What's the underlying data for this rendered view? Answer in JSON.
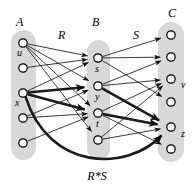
{
  "figure": {
    "title_label_bottom": "R*S",
    "colors": {
      "column_fill": "#d8d8d8",
      "node_stroke": "#000000",
      "node_fill": "#ffffff",
      "edge": "#1a1a1a",
      "background": "#ffffff"
    },
    "set_labels": [
      {
        "name": "A",
        "text": "A",
        "x": 16,
        "y": 26
      },
      {
        "name": "B",
        "text": "B",
        "x": 92,
        "y": 26
      },
      {
        "name": "C",
        "text": "C",
        "x": 168,
        "y": 17
      }
    ],
    "relation_labels": [
      {
        "name": "R",
        "text": "R",
        "x": 58,
        "y": 39
      },
      {
        "name": "S",
        "text": "S",
        "x": 133,
        "y": 39
      },
      {
        "name": "RS",
        "text": "R*S",
        "x": 97,
        "y": 180
      }
    ],
    "columns": [
      {
        "name": "A",
        "x": 11,
        "y": 30,
        "w": 25,
        "h": 130
      },
      {
        "name": "B",
        "x": 87,
        "y": 40,
        "w": 23,
        "h": 120
      },
      {
        "name": "C",
        "x": 158,
        "y": 22,
        "w": 26,
        "h": 140
      }
    ],
    "nodes": [
      {
        "id": "a1",
        "set": "A",
        "label": "u",
        "cx": 23,
        "cy": 43,
        "lx": 17,
        "ly": 56
      },
      {
        "id": "a2",
        "set": "A",
        "label": "",
        "cx": 23,
        "cy": 68,
        "lx": 0,
        "ly": 0
      },
      {
        "id": "a3",
        "set": "A",
        "label": "x",
        "cx": 23,
        "cy": 93,
        "lx": 15,
        "ly": 106
      },
      {
        "id": "a4",
        "set": "A",
        "label": "",
        "cx": 23,
        "cy": 118,
        "lx": 0,
        "ly": 0
      },
      {
        "id": "a5",
        "set": "A",
        "label": "",
        "cx": 23,
        "cy": 143,
        "lx": 0,
        "ly": 0
      },
      {
        "id": "b1",
        "set": "B",
        "label": "s",
        "cx": 98,
        "cy": 58,
        "lx": 95,
        "ly": 72
      },
      {
        "id": "b2",
        "set": "B",
        "label": "y",
        "cx": 98,
        "cy": 86,
        "lx": 95,
        "ly": 100
      },
      {
        "id": "b3",
        "set": "B",
        "label": "t",
        "cx": 98,
        "cy": 113,
        "lx": 96,
        "ly": 127
      },
      {
        "id": "b4",
        "set": "B",
        "label": "",
        "cx": 98,
        "cy": 140,
        "lx": 0,
        "ly": 0
      },
      {
        "id": "c1",
        "set": "C",
        "label": "",
        "cx": 171,
        "cy": 35,
        "lx": 0,
        "ly": 0
      },
      {
        "id": "c2",
        "set": "C",
        "label": "",
        "cx": 171,
        "cy": 57,
        "lx": 0,
        "ly": 0
      },
      {
        "id": "c3",
        "set": "C",
        "label": "v",
        "cx": 171,
        "cy": 79,
        "lx": 181,
        "ly": 88
      },
      {
        "id": "c4",
        "set": "C",
        "label": "",
        "cx": 171,
        "cy": 102,
        "lx": 0,
        "ly": 0
      },
      {
        "id": "c5",
        "set": "C",
        "label": "z",
        "cx": 171,
        "cy": 127,
        "lx": 181,
        "ly": 137
      },
      {
        "id": "c6",
        "set": "C",
        "label": "",
        "cx": 171,
        "cy": 149,
        "lx": 0,
        "ly": 0
      }
    ],
    "edges": [
      {
        "name": "u-s",
        "from": "a1",
        "to": "b1",
        "bold": false
      },
      {
        "name": "u-y",
        "from": "a1",
        "to": "b2",
        "bold": false
      },
      {
        "name": "u-t",
        "from": "a1",
        "to": "b3",
        "bold": false
      },
      {
        "name": "u-b4",
        "from": "a1",
        "to": "b4",
        "bold": false
      },
      {
        "name": "a2-s",
        "from": "a2",
        "to": "b1",
        "bold": false
      },
      {
        "name": "x-s",
        "from": "a3",
        "to": "b1",
        "bold": false
      },
      {
        "name": "x-y",
        "from": "a3",
        "to": "b2",
        "bold": true
      },
      {
        "name": "x-t",
        "from": "a3",
        "to": "b3",
        "bold": true
      },
      {
        "name": "a4-y",
        "from": "a4",
        "to": "b2",
        "bold": false
      },
      {
        "name": "a4-t",
        "from": "a4",
        "to": "b3",
        "bold": false
      },
      {
        "name": "a5-t",
        "from": "a5",
        "to": "b3",
        "bold": false
      },
      {
        "name": "s-c1",
        "from": "b1",
        "to": "c1",
        "bold": false
      },
      {
        "name": "s-c2",
        "from": "b1",
        "to": "c2",
        "bold": false
      },
      {
        "name": "s-c4",
        "from": "b1",
        "to": "c4",
        "bold": false
      },
      {
        "name": "y-c2",
        "from": "b2",
        "to": "c2",
        "bold": false
      },
      {
        "name": "y-c3",
        "from": "b2",
        "to": "c3",
        "bold": false
      },
      {
        "name": "y-z",
        "from": "b2",
        "to": "c5",
        "bold": true
      },
      {
        "name": "t-c3",
        "from": "b3",
        "to": "c3",
        "bold": false
      },
      {
        "name": "t-z",
        "from": "b3",
        "to": "c5",
        "bold": true
      },
      {
        "name": "t-c6",
        "from": "b3",
        "to": "c6",
        "bold": false
      },
      {
        "name": "b4-c3",
        "from": "b4",
        "to": "c3",
        "bold": false
      },
      {
        "name": "b4-z",
        "from": "b4",
        "to": "c5",
        "bold": false
      }
    ],
    "composite_edge": {
      "name": "x-to-z-composite",
      "from": "a3",
      "to": "c5",
      "bold": true
    }
  }
}
